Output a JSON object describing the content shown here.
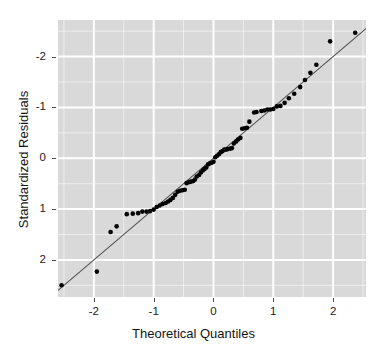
{
  "chart": {
    "type": "scatter",
    "title": "",
    "x_axis_title": "Theoretical Quantiles",
    "y_axis_title": "Standardized Residuals",
    "x_tick_labels": [
      "-2",
      "-1",
      "0",
      "1",
      "2"
    ],
    "y_tick_labels": [
      "2",
      "1",
      "0",
      "-1",
      "-2"
    ],
    "panel_background_color": "#d9d9d9",
    "gridline_color": "#ffffff",
    "point_color": "#000000",
    "reference_line_color": "#4d4d4d"
  },
  "chart_data": {
    "type": "scatter",
    "title": "",
    "xlabel": "Theoretical Quantiles",
    "ylabel": "Standardized Residuals",
    "xlim": [
      -2.6,
      2.55
    ],
    "ylim": [
      -2.73,
      2.72
    ],
    "xticks": [
      -2,
      -1,
      0,
      1,
      2
    ],
    "yticks": [
      -2,
      -1,
      0,
      1,
      2
    ],
    "grid": true,
    "legend": "none",
    "annotations": [],
    "reference_line": {
      "type": "qq-line",
      "slope": 1.0,
      "intercept": 0.0,
      "x_range": [
        -2.6,
        2.55
      ],
      "y_range": [
        -2.6,
        2.55
      ]
    },
    "series": [
      {
        "name": "Standardized residuals",
        "marker": "filled-circle",
        "color": "#000000",
        "points": [
          [
            -2.54,
            -2.5
          ],
          [
            -1.95,
            -2.23
          ],
          [
            -1.72,
            -1.45
          ],
          [
            -1.62,
            -1.34
          ],
          [
            -1.45,
            -1.1
          ],
          [
            -1.35,
            -1.09
          ],
          [
            -1.26,
            -1.08
          ],
          [
            -1.19,
            -1.05
          ],
          [
            -1.12,
            -1.05
          ],
          [
            -1.06,
            -1.04
          ],
          [
            -1.0,
            -1.01
          ],
          [
            -0.95,
            -0.96
          ],
          [
            -0.9,
            -0.93
          ],
          [
            -0.85,
            -0.9
          ],
          [
            -0.8,
            -0.88
          ],
          [
            -0.76,
            -0.85
          ],
          [
            -0.72,
            -0.82
          ],
          [
            -0.68,
            -0.78
          ],
          [
            -0.64,
            -0.72
          ],
          [
            -0.6,
            -0.66
          ],
          [
            -0.56,
            -0.64
          ],
          [
            -0.52,
            -0.63
          ],
          [
            -0.48,
            -0.62
          ],
          [
            -0.45,
            -0.49
          ],
          [
            -0.41,
            -0.47
          ],
          [
            -0.38,
            -0.46
          ],
          [
            -0.34,
            -0.45
          ],
          [
            -0.31,
            -0.42
          ],
          [
            -0.28,
            -0.36
          ],
          [
            -0.24,
            -0.33
          ],
          [
            -0.21,
            -0.28
          ],
          [
            -0.18,
            -0.24
          ],
          [
            -0.15,
            -0.21
          ],
          [
            -0.12,
            -0.18
          ],
          [
            -0.09,
            -0.12
          ],
          [
            -0.06,
            -0.1
          ],
          [
            -0.03,
            -0.09
          ],
          [
            0.0,
            -0.07
          ],
          [
            0.03,
            0.02
          ],
          [
            0.06,
            0.05
          ],
          [
            0.09,
            0.08
          ],
          [
            0.12,
            0.12
          ],
          [
            0.15,
            0.14
          ],
          [
            0.18,
            0.17
          ],
          [
            0.21,
            0.17
          ],
          [
            0.24,
            0.18
          ],
          [
            0.28,
            0.19
          ],
          [
            0.31,
            0.2
          ],
          [
            0.34,
            0.29
          ],
          [
            0.38,
            0.33
          ],
          [
            0.41,
            0.37
          ],
          [
            0.45,
            0.4
          ],
          [
            0.48,
            0.58
          ],
          [
            0.52,
            0.59
          ],
          [
            0.56,
            0.6
          ],
          [
            0.6,
            0.72
          ],
          [
            0.68,
            0.9
          ],
          [
            0.72,
            0.91
          ],
          [
            0.8,
            0.93
          ],
          [
            0.85,
            0.94
          ],
          [
            0.9,
            0.96
          ],
          [
            0.95,
            0.96
          ],
          [
            1.0,
            0.97
          ],
          [
            1.06,
            1.02
          ],
          [
            1.12,
            1.03
          ],
          [
            1.19,
            1.09
          ],
          [
            1.26,
            1.18
          ],
          [
            1.35,
            1.27
          ],
          [
            1.45,
            1.4
          ],
          [
            1.53,
            1.54
          ],
          [
            1.62,
            1.68
          ],
          [
            1.72,
            1.84
          ],
          [
            1.95,
            2.3
          ],
          [
            2.37,
            2.47
          ]
        ]
      }
    ]
  }
}
